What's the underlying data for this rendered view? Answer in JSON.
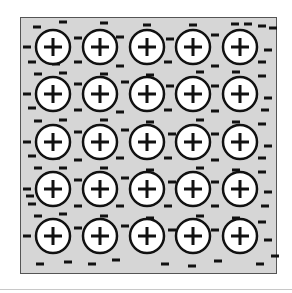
{
  "diagram": {
    "colors": {
      "background": "#d6d6d6",
      "border": "#555555",
      "ion_fill": "#ffffff",
      "ion_stroke": "#111111",
      "electron": "#111111"
    },
    "ion_symbol": "+",
    "electron_symbol": "-",
    "grid": {
      "rows": 5,
      "cols": 5
    },
    "ion_radius": 17,
    "ion_centers_x": [
      53,
      100,
      147,
      193,
      240
    ],
    "ion_centers_y": [
      47,
      94,
      142,
      189,
      236
    ],
    "electrons": [
      [
        37,
        27
      ],
      [
        63,
        22
      ],
      [
        104,
        23
      ],
      [
        147,
        25
      ],
      [
        193,
        25
      ],
      [
        235,
        24
      ],
      [
        248,
        24
      ],
      [
        262,
        26
      ],
      [
        273,
        28
      ],
      [
        27,
        47
      ],
      [
        78,
        38
      ],
      [
        120,
        37
      ],
      [
        170,
        39
      ],
      [
        215,
        35
      ],
      [
        268,
        50
      ],
      [
        32,
        62
      ],
      [
        56,
        64
      ],
      [
        78,
        62
      ],
      [
        120,
        66
      ],
      [
        168,
        62
      ],
      [
        215,
        66
      ],
      [
        262,
        62
      ],
      [
        38,
        74
      ],
      [
        63,
        73
      ],
      [
        104,
        74
      ],
      [
        150,
        75
      ],
      [
        200,
        72
      ],
      [
        236,
        72
      ],
      [
        262,
        76
      ],
      [
        27,
        94
      ],
      [
        78,
        84
      ],
      [
        125,
        82
      ],
      [
        170,
        86
      ],
      [
        215,
        86
      ],
      [
        268,
        98
      ],
      [
        32,
        108
      ],
      [
        78,
        110
      ],
      [
        120,
        112
      ],
      [
        168,
        110
      ],
      [
        215,
        111
      ],
      [
        265,
        110
      ],
      [
        38,
        121
      ],
      [
        63,
        120
      ],
      [
        104,
        120
      ],
      [
        150,
        122
      ],
      [
        200,
        120
      ],
      [
        236,
        122
      ],
      [
        262,
        124
      ],
      [
        27,
        142
      ],
      [
        78,
        132
      ],
      [
        125,
        130
      ],
      [
        172,
        134
      ],
      [
        215,
        134
      ],
      [
        268,
        146
      ],
      [
        32,
        156
      ],
      [
        56,
        158
      ],
      [
        78,
        160
      ],
      [
        120,
        158
      ],
      [
        168,
        158
      ],
      [
        215,
        160
      ],
      [
        262,
        158
      ],
      [
        38,
        168
      ],
      [
        63,
        168
      ],
      [
        104,
        168
      ],
      [
        150,
        170
      ],
      [
        200,
        168
      ],
      [
        236,
        170
      ],
      [
        262,
        172
      ],
      [
        27,
        189
      ],
      [
        30,
        196
      ],
      [
        78,
        180
      ],
      [
        125,
        178
      ],
      [
        172,
        182
      ],
      [
        215,
        182
      ],
      [
        268,
        192
      ],
      [
        32,
        204
      ],
      [
        78,
        206
      ],
      [
        120,
        206
      ],
      [
        168,
        206
      ],
      [
        215,
        206
      ],
      [
        265,
        206
      ],
      [
        38,
        216
      ],
      [
        63,
        214
      ],
      [
        104,
        216
      ],
      [
        150,
        218
      ],
      [
        200,
        216
      ],
      [
        236,
        218
      ],
      [
        262,
        222
      ],
      [
        27,
        236
      ],
      [
        78,
        228
      ],
      [
        125,
        226
      ],
      [
        172,
        230
      ],
      [
        215,
        230
      ],
      [
        268,
        240
      ],
      [
        40,
        264
      ],
      [
        68,
        262
      ],
      [
        92,
        264
      ],
      [
        116,
        260
      ],
      [
        165,
        264
      ],
      [
        192,
        266
      ],
      [
        218,
        261
      ],
      [
        260,
        264
      ],
      [
        275,
        256
      ]
    ]
  }
}
